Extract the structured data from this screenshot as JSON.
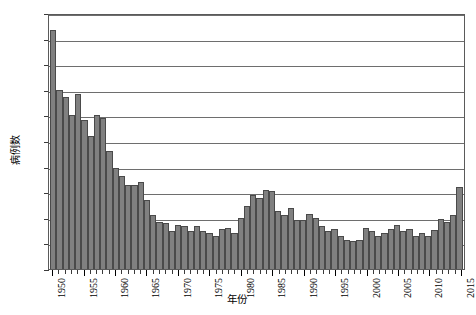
{
  "chart_data": {
    "type": "bar",
    "title": "",
    "subtitle": "",
    "xlabel": "年份",
    "ylabel": "病例数",
    "ylim": [
      0,
      1000
    ],
    "ytick_step": 100,
    "yticks": [
      "0",
      "100",
      "200",
      "300",
      "400",
      "500",
      "600",
      "700",
      "800",
      "900",
      "1000"
    ],
    "grid": true,
    "grid_axis": "y",
    "legend": false,
    "legend_position": "none",
    "bar_color": "#808080",
    "bar_edge_color": "#4a4a4a",
    "axis_color": "#5a5a5a",
    "background": "#ffffff",
    "xtick_labels": [
      "1950",
      "1955",
      "1960",
      "1965",
      "1970",
      "1975",
      "1980",
      "1985",
      "1990",
      "1995",
      "2000",
      "2005",
      "2010",
      "2015"
    ],
    "xtick_years": [
      1950,
      1955,
      1960,
      1965,
      1970,
      1975,
      1980,
      1985,
      1990,
      1995,
      2000,
      2005,
      2010,
      2015
    ],
    "categories": [
      1950,
      1951,
      1952,
      1953,
      1954,
      1955,
      1956,
      1957,
      1958,
      1959,
      1960,
      1961,
      1962,
      1963,
      1964,
      1965,
      1966,
      1967,
      1968,
      1969,
      1970,
      1971,
      1972,
      1973,
      1974,
      1975,
      1976,
      1977,
      1978,
      1979,
      1980,
      1981,
      1982,
      1983,
      1984,
      1985,
      1986,
      1987,
      1988,
      1989,
      1990,
      1991,
      1992,
      1993,
      1994,
      1995,
      1996,
      1997,
      1998,
      1999,
      2000,
      2001,
      2002,
      2003,
      2004,
      2005,
      2006,
      2007,
      2008,
      2009,
      2010,
      2011,
      2012,
      2013,
      2014,
      2015
    ],
    "values": [
      935,
      700,
      670,
      600,
      683,
      583,
      520,
      600,
      588,
      462,
      393,
      365,
      327,
      327,
      338,
      270,
      210,
      185,
      180,
      148,
      172,
      168,
      148,
      167,
      150,
      142,
      128,
      157,
      160,
      142,
      200,
      248,
      290,
      278,
      308,
      303,
      228,
      212,
      240,
      192,
      190,
      215,
      198,
      168,
      148,
      155,
      130,
      112,
      108,
      112,
      160,
      150,
      128,
      140,
      155,
      172,
      148,
      158,
      128,
      142,
      128,
      152,
      195,
      182,
      212,
      320
    ]
  }
}
